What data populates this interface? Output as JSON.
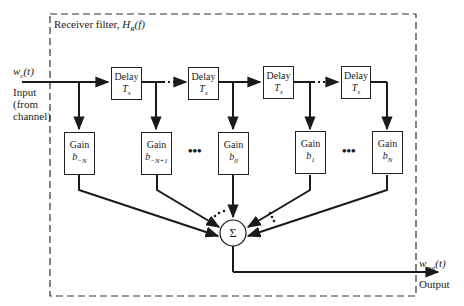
{
  "diagram": {
    "title_parts": {
      "prefix": "Receiver filter, ",
      "H": "H",
      "sub": "R",
      "arg": "(f)"
    },
    "input": {
      "signal": "w",
      "signal_sub": "c",
      "signal_arg": "(t)",
      "label_lines": [
        "Input",
        "(from",
        "channel)"
      ]
    },
    "output": {
      "signal": "w",
      "signal_sub": "out",
      "signal_arg": "(t)",
      "label": "Output"
    },
    "delays": [
      {
        "label": "Delay",
        "value": "T",
        "value_sub": "s"
      },
      {
        "label": "Delay",
        "value": "T",
        "value_sub": "s"
      },
      {
        "label": "Delay",
        "value": "T",
        "value_sub": "s"
      },
      {
        "label": "Delay",
        "value": "T",
        "value_sub": "s"
      }
    ],
    "gains": [
      {
        "label": "Gain",
        "coef": "b",
        "coef_sub": "−N"
      },
      {
        "label": "Gain",
        "coef": "b",
        "coef_sub": "−N+1"
      },
      {
        "label": "Gain",
        "coef": "b",
        "coef_sub": "0"
      },
      {
        "label": "Gain",
        "coef": "b",
        "coef_sub": "1"
      },
      {
        "label": "Gain",
        "coef": "b",
        "coef_sub": "N"
      }
    ],
    "ellipsis": "•••",
    "summer": "Σ",
    "colors": {
      "line": "#1a1a1a",
      "background": "#ffffff"
    }
  }
}
